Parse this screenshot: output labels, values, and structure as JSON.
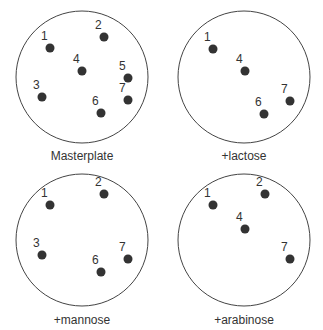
{
  "plates": [
    {
      "label": "Masterplate",
      "center": [
        82,
        77
      ],
      "radius": 66,
      "label_pos": [
        82,
        160
      ],
      "colonies": [
        {
          "id": "1",
          "x": 50,
          "y": 48
        },
        {
          "id": "2",
          "x": 104,
          "y": 37
        },
        {
          "id": "3",
          "x": 42,
          "y": 97
        },
        {
          "id": "4",
          "x": 82,
          "y": 71
        },
        {
          "id": "5",
          "x": 128,
          "y": 78
        },
        {
          "id": "6",
          "x": 101,
          "y": 113
        },
        {
          "id": "7",
          "x": 128,
          "y": 100
        }
      ]
    },
    {
      "label": "+lactose",
      "center": [
        244,
        77
      ],
      "radius": 66,
      "label_pos": [
        244,
        160
      ],
      "colonies": [
        {
          "id": "1",
          "x": 213,
          "y": 49
        },
        {
          "id": "4",
          "x": 245,
          "y": 71
        },
        {
          "id": "6",
          "x": 264,
          "y": 114
        },
        {
          "id": "7",
          "x": 290,
          "y": 101
        }
      ]
    },
    {
      "label": "+mannose",
      "center": [
        82,
        240
      ],
      "radius": 66,
      "label_pos": [
        82,
        324
      ],
      "colonies": [
        {
          "id": "1",
          "x": 50,
          "y": 205
        },
        {
          "id": "2",
          "x": 104,
          "y": 194
        },
        {
          "id": "3",
          "x": 42,
          "y": 255
        },
        {
          "id": "6",
          "x": 101,
          "y": 272
        },
        {
          "id": "7",
          "x": 128,
          "y": 259
        }
      ]
    },
    {
      "label": "+arabinose",
      "center": [
        244,
        240
      ],
      "radius": 66,
      "label_pos": [
        244,
        324
      ],
      "colonies": [
        {
          "id": "1",
          "x": 213,
          "y": 205
        },
        {
          "id": "2",
          "x": 265,
          "y": 194
        },
        {
          "id": "4",
          "x": 245,
          "y": 229
        },
        {
          "id": "7",
          "x": 290,
          "y": 259
        }
      ]
    }
  ],
  "colors": {
    "outline": "#444444",
    "colony": "#333333",
    "text": "#333333",
    "background": "#ffffff"
  }
}
